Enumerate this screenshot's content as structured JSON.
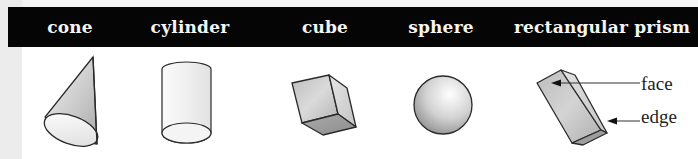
{
  "header": {
    "labels": [
      {
        "text": "cone",
        "x": 70
      },
      {
        "text": "cylinder",
        "x": 190
      },
      {
        "text": "cube",
        "x": 325
      },
      {
        "text": "sphere",
        "x": 441
      },
      {
        "text": "rectangular prism",
        "x": 602
      }
    ]
  },
  "shapes": [
    "cone",
    "cylinder",
    "cube",
    "sphere",
    "rectangular prism"
  ],
  "callouts": {
    "face": "face",
    "edge": "edge"
  },
  "colors": {
    "header_bg": "#050505",
    "header_text": "#f4f4f4",
    "outline": "#2a2a2a",
    "fill_light": "#eeeeee",
    "fill_mid": "#c8c8c8",
    "fill_dark": "#9a9a9a"
  }
}
